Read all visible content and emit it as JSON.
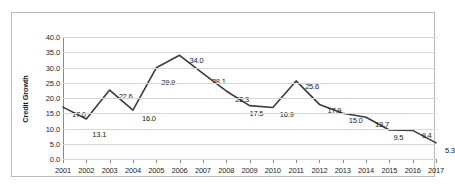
{
  "chart_data": {
    "type": "line",
    "title": "",
    "xlabel": "",
    "ylabel": "Credit Growth",
    "ylim": [
      0.0,
      40.0
    ],
    "ytick_step": 5.0,
    "yticks": [
      "0.0",
      "5.0",
      "10.0",
      "15.0",
      "20.0",
      "25.0",
      "30.0",
      "35.0",
      "40.0"
    ],
    "grid": true,
    "legend": "none",
    "line_color": "#3b3b3b",
    "categories": [
      "2001",
      "2002",
      "2003",
      "2004",
      "2005",
      "2006",
      "2007",
      "2008",
      "2009",
      "2010",
      "2011",
      "2012",
      "2013",
      "2014",
      "2015",
      "2016",
      "2017"
    ],
    "values": [
      17.0,
      13.1,
      22.6,
      16.0,
      29.9,
      34.0,
      28.1,
      22.3,
      17.5,
      16.9,
      25.6,
      17.9,
      15.0,
      13.7,
      9.5,
      9.4,
      5.3
    ],
    "data_labels": [
      "17.0",
      "13.1",
      "22.6",
      "16.0",
      "29.9",
      "34.0",
      "28.1",
      "22.3",
      "17.5",
      "16.9",
      "25.6",
      "17.9",
      "15.0",
      "13.7",
      "9.5",
      "9.4",
      "5.3"
    ],
    "label_offsets": [
      {
        "dx": 9,
        "dy": 3
      },
      {
        "dx": 6,
        "dy": 11
      },
      {
        "dx": 9,
        "dy": 2
      },
      {
        "dx": 9,
        "dy": 4
      },
      {
        "dx": 5,
        "dy": 10
      },
      {
        "dx": 10,
        "dy": 1
      },
      {
        "dx": 9,
        "dy": 4
      },
      {
        "dx": 9,
        "dy": 4
      },
      {
        "dx": 0,
        "dy": 3
      },
      {
        "dx": 7,
        "dy": 3
      },
      {
        "dx": 9,
        "dy": 1
      },
      {
        "dx": 8,
        "dy": 2
      },
      {
        "dx": 6,
        "dy": 3
      },
      {
        "dx": 9,
        "dy": 3
      },
      {
        "dx": 4,
        "dy": 3
      },
      {
        "dx": 9,
        "dy": 1
      },
      {
        "dx": 9,
        "dy": 3
      }
    ]
  }
}
